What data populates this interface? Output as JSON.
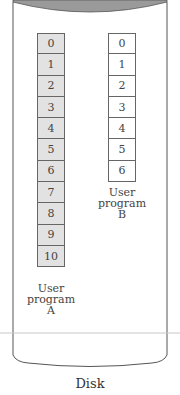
{
  "diagram": {
    "container": {
      "shape": "cylinder",
      "label": "Disk",
      "top_fill_color": "#9a9a9a"
    },
    "programs": [
      {
        "name": "User program A",
        "label_lines": [
          "User",
          "program",
          "A"
        ],
        "fill_color": "#e2e2e2",
        "pages": [
          "0",
          "1",
          "2",
          "3",
          "4",
          "5",
          "6",
          "7",
          "8",
          "9",
          "10"
        ]
      },
      {
        "name": "User program B",
        "label_lines": [
          "User",
          "program",
          "B"
        ],
        "fill_color": "#ffffff",
        "pages": [
          "0",
          "1",
          "2",
          "3",
          "4",
          "5",
          "6"
        ]
      }
    ]
  }
}
